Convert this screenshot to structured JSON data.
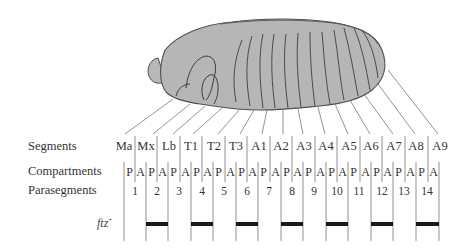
{
  "figure": {
    "colors": {
      "embryo_fill": "#b6b6b6",
      "embryo_outline": "#505050",
      "line": "#6a6a6a",
      "stripe": "#1a1a1a"
    }
  },
  "rows": {
    "segments_label": "Segments",
    "compartments_label": "Compartments",
    "parasegments_label": "Parasegments",
    "gene_label": "ftz",
    "gene_superscript": "+"
  },
  "segments": [
    "Ma",
    "Mx",
    "Lb",
    "T1",
    "T2",
    "T3",
    "A1",
    "A2",
    "A3",
    "A4",
    "A5",
    "A6",
    "A7",
    "A8",
    "A9"
  ],
  "compartments": [
    "P",
    "A",
    "P",
    "A",
    "P",
    "A",
    "P",
    "A",
    "P",
    "A",
    "P",
    "A",
    "P",
    "A",
    "P",
    "A",
    "P",
    "A",
    "P",
    "A",
    "P",
    "A",
    "P",
    "A",
    "P",
    "A",
    "P",
    "A"
  ],
  "parasegments": [
    "1",
    "2",
    "3",
    "4",
    "5",
    "6",
    "7",
    "8",
    "9",
    "10",
    "11",
    "12",
    "13",
    "14"
  ],
  "ftz_expressed_parasegments": [
    2,
    4,
    6,
    8,
    10,
    12,
    14
  ]
}
